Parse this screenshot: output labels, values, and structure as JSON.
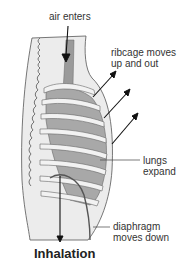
{
  "diagram": {
    "title": "Inhalation",
    "labels": {
      "air": "air enters",
      "ribcage_line1": "ribcage moves",
      "ribcage_line2": "up and out",
      "lungs_line1": "lungs",
      "lungs_line2": "expand",
      "diaphragm_line1": "diaphragm",
      "diaphragm_line2": "moves down"
    },
    "colors": {
      "body_fill": "#ececec",
      "outline": "#555555",
      "lung": "#a8a8a8",
      "trachea": "#9a9a9a",
      "rib": "#f2f2f2",
      "arrow": "#111111",
      "text": "#333333"
    }
  }
}
